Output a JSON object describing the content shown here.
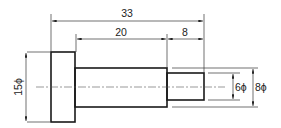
{
  "drawing": {
    "type": "stepped shaft technical drawing",
    "dimensions": {
      "overall_length": "33",
      "middle_length": "20",
      "end_length": "8",
      "flange_diameter": "15ϕ",
      "end_diameter": "6ϕ",
      "middle_diameter": "8ϕ"
    },
    "colors": {
      "line": "#1a1a1a",
      "background": "#ffffff"
    }
  }
}
